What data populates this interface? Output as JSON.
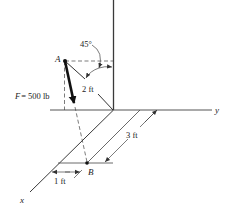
{
  "figure": {
    "type": "3d-force-vector-diagram",
    "axes": {
      "x_label": "x",
      "y_label": "y",
      "z_label": ""
    },
    "points": {
      "A_label": "A",
      "B_label": "B"
    },
    "force": {
      "label": "F = 500 lb",
      "symbol": "F",
      "value_text": "= 500 lb"
    },
    "dimensions": {
      "angle": "45°",
      "length_AO": "2 ft",
      "length_3": "3 ft",
      "length_1": "1 ft"
    },
    "colors": {
      "line": "#3a3a3a",
      "force_arrow": "#111111",
      "background": "#ffffff"
    }
  }
}
